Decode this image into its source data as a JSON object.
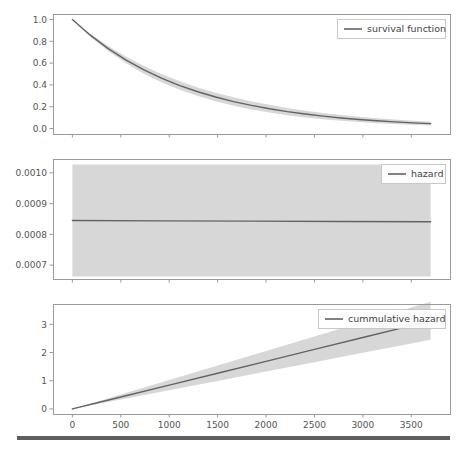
{
  "figure": {
    "width": 463,
    "height": 449,
    "background": "#ffffff",
    "line_color": "#636363",
    "band_color": "#c9c9c9",
    "band_opacity": 0.75,
    "spine_color": "#9a9a9a",
    "tick_text_color": "#555555",
    "footer_bar_color": "#5e5e5e"
  },
  "footer": {
    "name": "bottom-rule",
    "x": 17,
    "y": 436,
    "width": 433,
    "height": 4
  },
  "chart_data": [
    {
      "type": "line",
      "panel": "survival",
      "title": "",
      "xlabel": "",
      "ylabel": "",
      "xlim": [
        -200,
        3900
      ],
      "ylim": [
        -0.05,
        1.05
      ],
      "xticks": [
        0,
        500,
        1000,
        1500,
        2000,
        2500,
        3000,
        3500
      ],
      "xticklabels": [
        "",
        "",
        "",
        "",
        "",
        "",
        "",
        ""
      ],
      "yticks": [
        0.0,
        0.2,
        0.4,
        0.6,
        0.8,
        1.0
      ],
      "yticklabels": [
        "0.0",
        "0.2",
        "0.4",
        "0.6",
        "0.8",
        "1.0"
      ],
      "grid": false,
      "legend": {
        "entries": [
          "survival function"
        ],
        "position": "upper right"
      },
      "series": [
        {
          "name": "survival function",
          "x": [
            0,
            185,
            370,
            555,
            740,
            925,
            1110,
            1295,
            1480,
            1665,
            1850,
            2035,
            2220,
            2405,
            2590,
            2775,
            2960,
            3145,
            3330,
            3515,
            3700
          ],
          "values": [
            1.0,
            0.856,
            0.733,
            0.628,
            0.538,
            0.46,
            0.394,
            0.337,
            0.289,
            0.247,
            0.212,
            0.181,
            0.155,
            0.133,
            0.114,
            0.097,
            0.083,
            0.071,
            0.061,
            0.052,
            0.045
          ],
          "ci_lower": [
            1.0,
            0.842,
            0.71,
            0.598,
            0.503,
            0.423,
            0.355,
            0.298,
            0.25,
            0.209,
            0.175,
            0.146,
            0.122,
            0.102,
            0.085,
            0.071,
            0.059,
            0.049,
            0.041,
            0.034,
            0.028
          ],
          "ci_upper": [
            1.0,
            0.869,
            0.756,
            0.658,
            0.573,
            0.498,
            0.434,
            0.377,
            0.329,
            0.286,
            0.249,
            0.217,
            0.189,
            0.164,
            0.143,
            0.125,
            0.109,
            0.095,
            0.083,
            0.072,
            0.063
          ]
        }
      ]
    },
    {
      "type": "line",
      "panel": "hazard",
      "title": "",
      "xlabel": "",
      "ylabel": "",
      "xlim": [
        -200,
        3900
      ],
      "ylim": [
        0.000655,
        0.001045
      ],
      "xticks": [
        0,
        500,
        1000,
        1500,
        2000,
        2500,
        3000,
        3500
      ],
      "xticklabels": [
        "",
        "",
        "",
        "",
        "",
        "",
        "",
        ""
      ],
      "yticks": [
        0.0007,
        0.0008,
        0.0009,
        0.001
      ],
      "yticklabels": [
        "0.0007",
        "0.0008",
        "0.0009",
        "0.0010"
      ],
      "grid": false,
      "legend": {
        "entries": [
          "hazard"
        ],
        "position": "upper right"
      },
      "series": [
        {
          "name": "hazard",
          "x": [
            0,
            925,
            1850,
            2775,
            3700
          ],
          "values": [
            0.000845,
            0.000844,
            0.000843,
            0.000842,
            0.000841
          ],
          "ci_lower": [
            0.000663,
            0.000663,
            0.000663,
            0.000663,
            0.000663
          ],
          "ci_upper": [
            0.001027,
            0.001027,
            0.001027,
            0.001027,
            0.001027
          ]
        }
      ]
    },
    {
      "type": "line",
      "panel": "cummulative_hazard",
      "title": "",
      "xlabel": "",
      "ylabel": "",
      "xlim": [
        -200,
        3900
      ],
      "ylim": [
        -0.18,
        3.72
      ],
      "xticks": [
        0,
        500,
        1000,
        1500,
        2000,
        2500,
        3000,
        3500
      ],
      "xticklabels": [
        "0",
        "500",
        "1000",
        "1500",
        "2000",
        "2500",
        "3000",
        "3500"
      ],
      "yticks": [
        0,
        1,
        2,
        3
      ],
      "yticklabels": [
        "0",
        "1",
        "2",
        "3"
      ],
      "grid": false,
      "legend": {
        "entries": [
          "cummulative hazard"
        ],
        "position": "upper right"
      },
      "series": [
        {
          "name": "cummulative hazard",
          "x": [
            0,
            500,
            1000,
            1500,
            2000,
            2500,
            3000,
            3500,
            3700
          ],
          "values": [
            0.0,
            0.422,
            0.844,
            1.266,
            1.688,
            2.11,
            2.532,
            2.954,
            3.123
          ],
          "ci_lower": [
            0.0,
            0.331,
            0.663,
            0.994,
            1.326,
            1.657,
            1.989,
            2.32,
            2.453
          ],
          "ci_upper": [
            0.0,
            0.513,
            1.027,
            1.54,
            2.053,
            2.566,
            3.08,
            3.593,
            3.798
          ]
        }
      ]
    }
  ],
  "panels": [
    {
      "name": "survival-panel",
      "plot_left": 53,
      "plot_top": 14,
      "plot_width": 397,
      "plot_height": 120,
      "legend_x": 337,
      "legend_y": 19,
      "legend_w": 108,
      "legend_h": 19
    },
    {
      "name": "hazard-panel",
      "plot_left": 53,
      "plot_top": 159,
      "plot_width": 397,
      "plot_height": 120,
      "legend_x": 381,
      "legend_y": 164,
      "legend_w": 64,
      "legend_h": 19
    },
    {
      "name": "cummulative-hazard-panel",
      "plot_left": 53,
      "plot_top": 304,
      "plot_width": 397,
      "plot_height": 110,
      "legend_x": 318,
      "legend_y": 309,
      "legend_w": 127,
      "legend_h": 19
    }
  ]
}
